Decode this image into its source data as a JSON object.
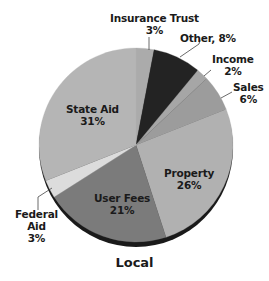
{
  "chart_data": {
    "type": "pie",
    "title": "Local",
    "start_angle_deg": 0,
    "direction": "clockwise",
    "slices": [
      {
        "label": "Insurance Trust",
        "value": 3,
        "display": "3%",
        "color": "#ababab"
      },
      {
        "label": "Other",
        "value": 8,
        "display": "8%",
        "color": "#232323"
      },
      {
        "label": "Income",
        "value": 2,
        "display": "2%",
        "color": "#a6a6a6"
      },
      {
        "label": "Sales",
        "value": 6,
        "display": "6%",
        "color": "#9c9c9c"
      },
      {
        "label": "Property",
        "value": 26,
        "display": "26%",
        "color": "#b1b1b1"
      },
      {
        "label": "User Fees",
        "value": 21,
        "display": "21%",
        "color": "#7b7b7b"
      },
      {
        "label": "Federal Aid",
        "value": 3,
        "display": "3%",
        "color": "#dcdcdc"
      },
      {
        "label": "State Aid",
        "value": 31,
        "display": "31%",
        "color": "#b5b5b5"
      }
    ],
    "unit": "%",
    "legend": "none (direct labels)"
  },
  "labels": {
    "insurance_trust": {
      "name": "Insurance Trust",
      "pct": "3%"
    },
    "other": {
      "text": "Other, 8%"
    },
    "income": {
      "name": "Income",
      "pct": "2%"
    },
    "sales": {
      "name": "Sales",
      "pct": "6%"
    },
    "property": {
      "name": "Property",
      "pct": "26%"
    },
    "user_fees": {
      "name": "User Fees",
      "pct": "21%"
    },
    "federal_aid": {
      "line1": "Federal",
      "line2": "Aid",
      "pct": "3%"
    },
    "state_aid": {
      "name": "State Aid",
      "pct": "31%"
    }
  },
  "title": "Local"
}
